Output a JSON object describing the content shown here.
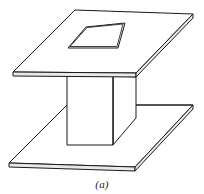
{
  "figure": {
    "caption": "(a)",
    "line_color": "#1a1a1a",
    "face_color": "#ffffff",
    "edge_fill_color": "#e9e9e9",
    "background_color": "#ffffff",
    "projection": "isometric",
    "parts": {
      "top_plate_label": "top plate",
      "bottom_plate_label": "bottom plate",
      "post_label": "central post",
      "aperture_label": "square aperture"
    },
    "geometry": {
      "top_plate_top_face": "13,72 75,10 193,14 136,73",
      "top_plate_front_left_edge": "13,72 136,73 136,77 13,76",
      "top_plate_right_edge": "136,73 193,14 193,18 136,77",
      "aperture": "68,48 86,27 125,23 118,48",
      "aperture_inner": "70,47 87,29 122,25 116,47",
      "post_front_face": "67,76 113,76 113,145 67,145",
      "post_right_face": "113,76 136,77 136,118 113,145",
      "bottom_plate_top_face": "9,163 67,105 193,105 135,167",
      "bottom_plate_front_edge": "9,163 135,167 135,171 9,167",
      "bottom_plate_right_edge": "135,167 193,105 193,109 135,171",
      "bottom_back_edge_left": "9,163 67,105",
      "bottom_back_edge_right": "136,105 193,105"
    }
  }
}
